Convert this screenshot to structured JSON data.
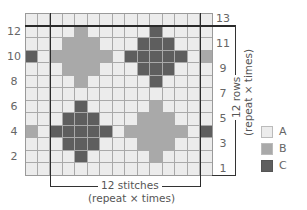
{
  "chart": {
    "columns": 15,
    "rows": 13,
    "colors": {
      "A": "#ececec",
      "B": "#a9a9a9",
      "C": "#5e5e5e"
    },
    "grid_top_to_bottom": [
      "AAAAAAAAAAAAAAA",
      "AAAABAAAAACAAAA",
      "AAABBBAAACCCAAA",
      "CABBBBBACCCCCAB",
      "AAABBBAAACCCAAA",
      "AAAABAAAAACAAAA",
      "AAAAAAAAAAAAAAA",
      "AAAACAAAAABAAAA",
      "AAACCCAAABBBAAA",
      "BACCCCCABBBBBAC",
      "AAACCCAAABBBAAA",
      "AAAACAAAAABAAAA",
      "AAAAAAAAAAAAAAA"
    ],
    "left_row_labels": [
      "12",
      "10",
      "8",
      "6",
      "4",
      "2"
    ],
    "right_row_labels": [
      "13",
      "11",
      "9",
      "7",
      "5",
      "3",
      "1"
    ]
  },
  "annotations": {
    "stitches_label": "12 stitches",
    "stitches_repeat": "(repeat × times)",
    "rows_label": "12 rows",
    "rows_repeat": "(repeat × times)"
  },
  "legend": [
    {
      "key": "A",
      "label": "A",
      "color": "#ececec"
    },
    {
      "key": "B",
      "label": "B",
      "color": "#a9a9a9"
    },
    {
      "key": "C",
      "label": "C",
      "color": "#5e5e5e"
    }
  ]
}
